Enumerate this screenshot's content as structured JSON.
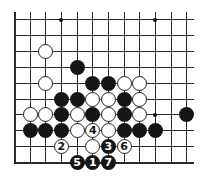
{
  "diagram": {
    "type": "go-board-fragment",
    "columns": 12,
    "rows": 10,
    "edges": {
      "left": "board-edge",
      "bottom": "board-edge",
      "top": "open",
      "right": "open"
    },
    "star_points": [
      [
        3,
        0
      ],
      [
        9,
        0
      ],
      [
        9,
        6
      ]
    ],
    "stones": [
      {
        "color": "white",
        "col": 2,
        "row": 2,
        "label": ""
      },
      {
        "color": "black",
        "col": 4,
        "row": 3,
        "label": ""
      },
      {
        "color": "white",
        "col": 2,
        "row": 4,
        "label": ""
      },
      {
        "color": "black",
        "col": 5,
        "row": 4,
        "label": ""
      },
      {
        "color": "black",
        "col": 6,
        "row": 4,
        "label": ""
      },
      {
        "color": "white",
        "col": 7,
        "row": 4,
        "label": ""
      },
      {
        "color": "white",
        "col": 8,
        "row": 4,
        "label": ""
      },
      {
        "color": "black",
        "col": 3,
        "row": 5,
        "label": ""
      },
      {
        "color": "black",
        "col": 4,
        "row": 5,
        "label": ""
      },
      {
        "color": "white",
        "col": 5,
        "row": 5,
        "label": ""
      },
      {
        "color": "white",
        "col": 6,
        "row": 5,
        "label": ""
      },
      {
        "color": "black",
        "col": 7,
        "row": 5,
        "label": ""
      },
      {
        "color": "white",
        "col": 8,
        "row": 5,
        "label": ""
      },
      {
        "color": "white",
        "col": 1,
        "row": 6,
        "label": ""
      },
      {
        "color": "white",
        "col": 2,
        "row": 6,
        "label": ""
      },
      {
        "color": "black",
        "col": 3,
        "row": 6,
        "label": ""
      },
      {
        "color": "white",
        "col": 4,
        "row": 6,
        "label": ""
      },
      {
        "color": "black",
        "col": 5,
        "row": 6,
        "label": ""
      },
      {
        "color": "white",
        "col": 6,
        "row": 6,
        "label": ""
      },
      {
        "color": "black",
        "col": 7,
        "row": 6,
        "label": ""
      },
      {
        "color": "white",
        "col": 8,
        "row": 6,
        "label": ""
      },
      {
        "color": "black",
        "col": 11,
        "row": 6,
        "label": ""
      },
      {
        "color": "black",
        "col": 1,
        "row": 7,
        "label": ""
      },
      {
        "color": "black",
        "col": 2,
        "row": 7,
        "label": ""
      },
      {
        "color": "black",
        "col": 3,
        "row": 7,
        "label": ""
      },
      {
        "color": "white",
        "col": 4,
        "row": 7,
        "label": ""
      },
      {
        "color": "white",
        "col": 5,
        "row": 7,
        "label": "4"
      },
      {
        "color": "white",
        "col": 6,
        "row": 7,
        "label": ""
      },
      {
        "color": "black",
        "col": 7,
        "row": 7,
        "label": ""
      },
      {
        "color": "black",
        "col": 8,
        "row": 7,
        "label": ""
      },
      {
        "color": "black",
        "col": 9,
        "row": 7,
        "label": ""
      },
      {
        "color": "white",
        "col": 3,
        "row": 8,
        "label": "2"
      },
      {
        "color": "white",
        "col": 5,
        "row": 8,
        "label": ""
      },
      {
        "color": "black",
        "col": 6,
        "row": 8,
        "label": "3"
      },
      {
        "color": "white",
        "col": 7,
        "row": 8,
        "label": "6"
      },
      {
        "color": "black",
        "col": 4,
        "row": 9,
        "label": "5"
      },
      {
        "color": "black",
        "col": 5,
        "row": 9,
        "label": "1"
      },
      {
        "color": "black",
        "col": 6,
        "row": 9,
        "label": "7"
      }
    ]
  }
}
